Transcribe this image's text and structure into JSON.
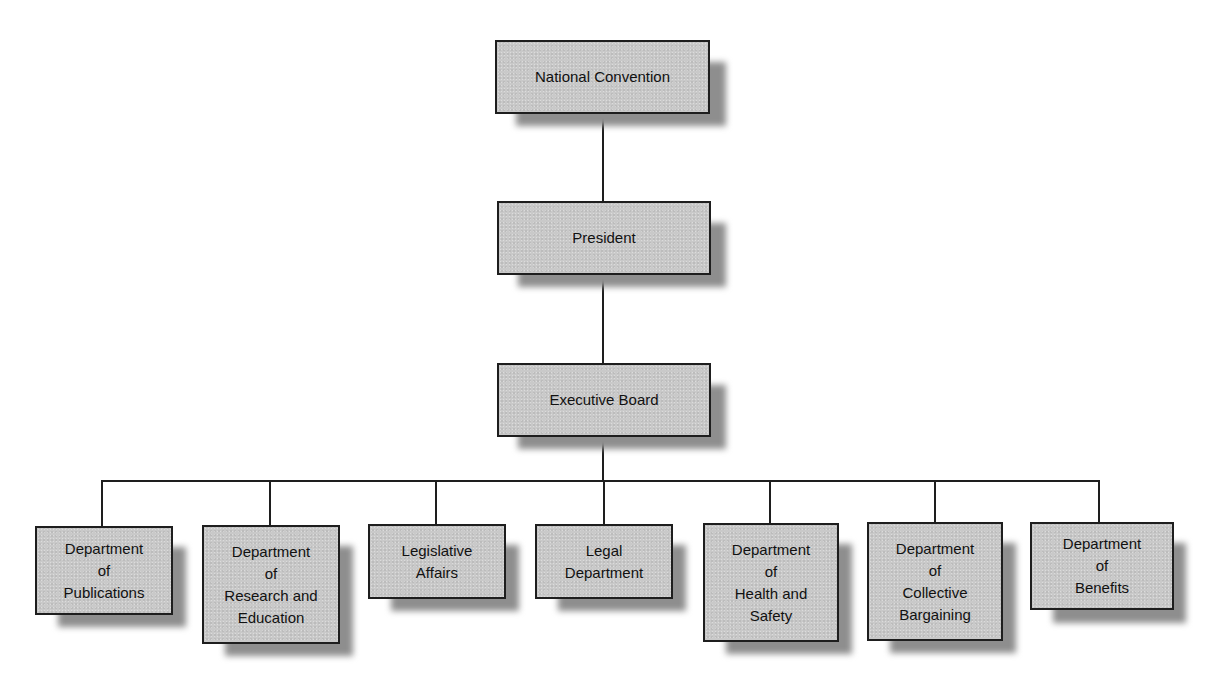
{
  "diagram": {
    "type": "org-chart",
    "colors": {
      "box_fill": "#c9c9c9",
      "box_border": "#1e1e1e",
      "connector": "#1e1e1e",
      "shadow": "#8e8e8e",
      "background": "#ffffff"
    },
    "nodes": {
      "national_convention": {
        "label": "National Convention"
      },
      "president": {
        "label": "President"
      },
      "executive_board": {
        "label": "Executive Board"
      },
      "departments": [
        {
          "label": "Department\nof\nPublications"
        },
        {
          "label": "Department\nof\nResearch and\nEducation"
        },
        {
          "label": "Legislative\nAffairs"
        },
        {
          "label": "Legal\nDepartment"
        },
        {
          "label": "Department\nof\nHealth and\nSafety"
        },
        {
          "label": "Department\nof\nCollective\nBargaining"
        },
        {
          "label": "Department\nof\nBenefits"
        }
      ]
    },
    "edges": [
      [
        "National Convention",
        "President"
      ],
      [
        "President",
        "Executive Board"
      ],
      [
        "Executive Board",
        "Department of Publications"
      ],
      [
        "Executive Board",
        "Department of Research and Education"
      ],
      [
        "Executive Board",
        "Legislative Affairs"
      ],
      [
        "Executive Board",
        "Legal Department"
      ],
      [
        "Executive Board",
        "Department of Health and Safety"
      ],
      [
        "Executive Board",
        "Department of Collective Bargaining"
      ],
      [
        "Executive Board",
        "Department of Benefits"
      ]
    ]
  }
}
